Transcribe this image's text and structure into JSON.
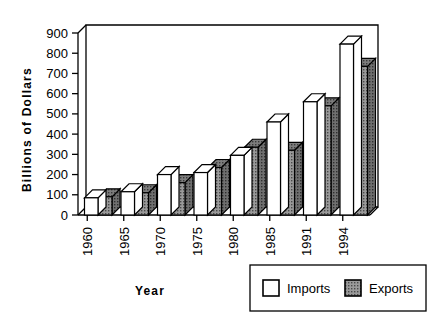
{
  "chart_data": {
    "type": "bar",
    "title": "",
    "subtitle": "",
    "xlabel": "Year",
    "ylabel": "Billions  of  Dollars",
    "categories": [
      "1960",
      "1965",
      "1970",
      "1975",
      "1980",
      "1985",
      "1991",
      "1994"
    ],
    "series": [
      {
        "name": "Imports",
        "values": [
          85,
          115,
          200,
          210,
          295,
          460,
          560,
          845
        ],
        "color": "#ffffff"
      },
      {
        "name": "Exports",
        "values": [
          90,
          110,
          160,
          235,
          335,
          320,
          540,
          735
        ],
        "color": "#8a8a8a"
      }
    ],
    "ylim": [
      0,
      900
    ],
    "yticks": [
      0,
      100,
      200,
      300,
      400,
      500,
      600,
      700,
      800,
      900
    ],
    "ytick_labels": [
      "0",
      "100",
      "200",
      "300",
      "400",
      "500",
      "600",
      "700",
      "800",
      "900"
    ],
    "grid": false,
    "legend_position": "bottom-right",
    "style": "3d-column",
    "edge_color": "#000000",
    "background": "#ffffff"
  },
  "legend": {
    "entries": [
      {
        "label": "Imports",
        "swatch": "white-swatch"
      },
      {
        "label": "Exports",
        "swatch": "gray-hatched-swatch"
      }
    ]
  },
  "axes": {
    "y_title": "Billions  of  Dollars",
    "x_title": "Year"
  }
}
